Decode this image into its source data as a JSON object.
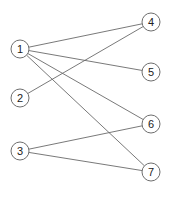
{
  "diagram": {
    "type": "bipartite-graph",
    "colors": {
      "node_stroke": "#6e6e6e",
      "edge": "#6a6a6a",
      "label": "#222222",
      "background": "#ffffff"
    },
    "nodes": [
      {
        "id": "1",
        "label": "1",
        "x": 20,
        "y": 49
      },
      {
        "id": "2",
        "label": "2",
        "x": 20,
        "y": 98
      },
      {
        "id": "3",
        "label": "3",
        "x": 20,
        "y": 151
      },
      {
        "id": "4",
        "label": "4",
        "x": 151,
        "y": 22
      },
      {
        "id": "5",
        "label": "5",
        "x": 151,
        "y": 72
      },
      {
        "id": "6",
        "label": "6",
        "x": 151,
        "y": 124
      },
      {
        "id": "7",
        "label": "7",
        "x": 151,
        "y": 172
      }
    ],
    "edges": [
      {
        "from": "1",
        "to": "4"
      },
      {
        "from": "1",
        "to": "5"
      },
      {
        "from": "1",
        "to": "6"
      },
      {
        "from": "1",
        "to": "7"
      },
      {
        "from": "2",
        "to": "4"
      },
      {
        "from": "3",
        "to": "6"
      },
      {
        "from": "3",
        "to": "7"
      }
    ]
  }
}
